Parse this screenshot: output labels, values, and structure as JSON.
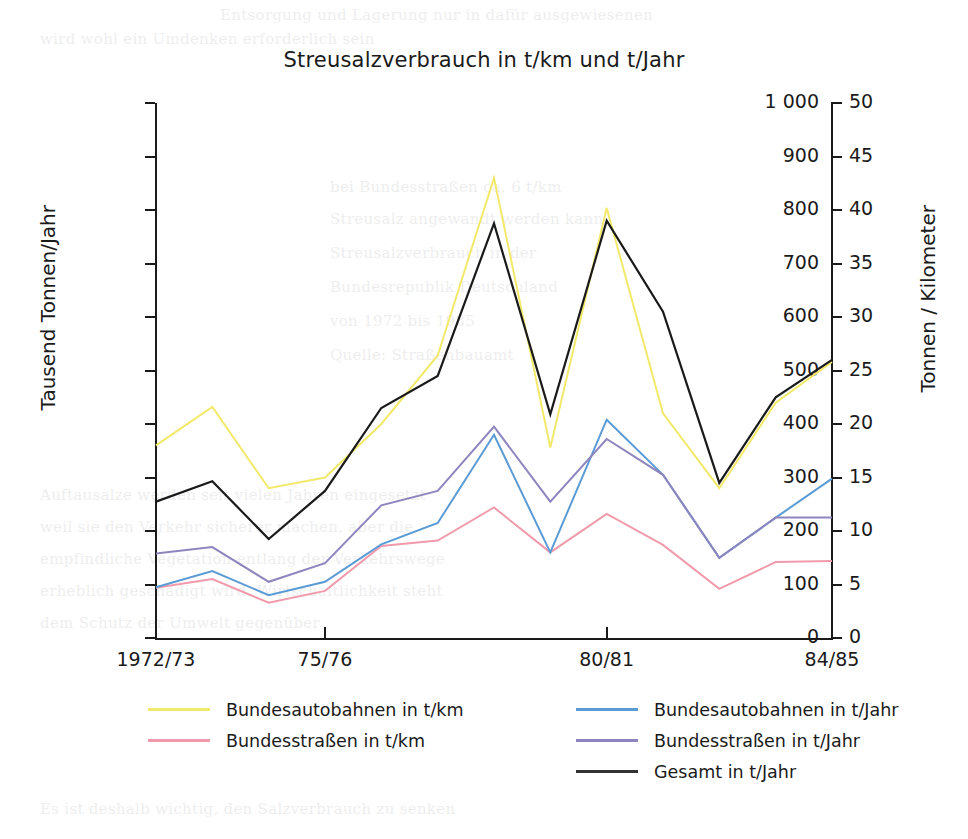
{
  "chart_data": {
    "type": "line",
    "title": "Streusalzverbrauch in t/km und t/Jahr",
    "xlabel": "",
    "ylabel": "Tausend Tonnen/Jahr",
    "ylabel_right": "Tonnen / Kilometer",
    "grid": false,
    "legend_position": "bottom",
    "x": [
      "1972/73",
      "1973/74",
      "1974/75",
      "1975/76",
      "1976/77",
      "1977/78",
      "1978/79",
      "1979/80",
      "1980/81",
      "1981/82",
      "1982/83",
      "1983/84",
      "1984/85"
    ],
    "xticks_shown": [
      "1972/73",
      "75/76",
      "80/81",
      "84/85"
    ],
    "ylim": [
      0,
      1000
    ],
    "yticks": [
      "0",
      "100",
      "200",
      "300",
      "400",
      "500",
      "600",
      "700",
      "800",
      "900",
      "1 000"
    ],
    "ylim_right": [
      0,
      50
    ],
    "yticks_right": [
      "0",
      "5",
      "10",
      "15",
      "20",
      "25",
      "30",
      "35",
      "40",
      "45",
      "50"
    ],
    "series": [
      {
        "name": "Bundesautobahnen in t/km",
        "axis": "right",
        "color": "#F2E96B",
        "values": [
          18.0,
          21.6,
          14.0,
          15.0,
          20.0,
          26.4,
          43.0,
          17.8,
          40.2,
          21.0,
          14.0,
          22.0,
          25.8
        ]
      },
      {
        "name": "Bundesstraßen in t/km",
        "axis": "right",
        "color": "#F09AAC",
        "values": [
          4.7,
          5.5,
          3.3,
          4.4,
          8.6,
          9.1,
          12.2,
          8.0,
          11.6,
          8.7,
          4.6,
          7.1,
          7.2
        ]
      },
      {
        "name": "Bundesautobahnen in t/Jahr",
        "axis": "left",
        "color": "#5B9BD5",
        "values": [
          95,
          125,
          80,
          105,
          175,
          215,
          380,
          160,
          408,
          305,
          150,
          225,
          298
        ]
      },
      {
        "name": "Bundesstraßen in t/Jahr",
        "axis": "left",
        "color": "#8F85BE",
        "values": [
          158,
          170,
          105,
          140,
          248,
          275,
          395,
          255,
          372,
          305,
          150,
          225,
          225
        ]
      },
      {
        "name": "Gesamt in t/Jahr",
        "axis": "left",
        "color": "#1a1a1a",
        "values": [
          255,
          293,
          185,
          275,
          430,
          490,
          775,
          418,
          780,
          610,
          290,
          450,
          520
        ]
      }
    ]
  },
  "axes": {
    "left_title": "Tausend Tonnen/Jahr",
    "right_title": "Tonnen / Kilometer"
  },
  "legend": {
    "columns": [
      {
        "items": [
          {
            "label": "Bundesautobahnen in t/km",
            "color": "#F2E96B"
          },
          {
            "label": "Bundesstraßen in t/km",
            "color": "#F09AAC"
          }
        ]
      },
      {
        "items": [
          {
            "label": "Bundesautobahnen in t/Jahr",
            "color": "#5B9BD5"
          },
          {
            "label": "Bundesstraßen in t/Jahr",
            "color": "#8F85BE"
          },
          {
            "label": "Gesamt in t/Jahr",
            "color": "#333333"
          }
        ]
      }
    ]
  },
  "page_ghost": {
    "lines": [
      "wird eine Entsorgung",
      "nicht weiter in Frage kommen",
      "Salzlagerung ist",
      "in Abstimmung mit der",
      "Umweltbehörde festgelegt",
      "die Streusalzmengen",
      "durch gezielte Vegetation",
      "der Straßenmeisterei",
      "Schutz der Pflanzen",
      "Versuche zeigen",
      "Erfolg versprechend",
      "Salzverbrauch der Winterdienste"
    ]
  }
}
